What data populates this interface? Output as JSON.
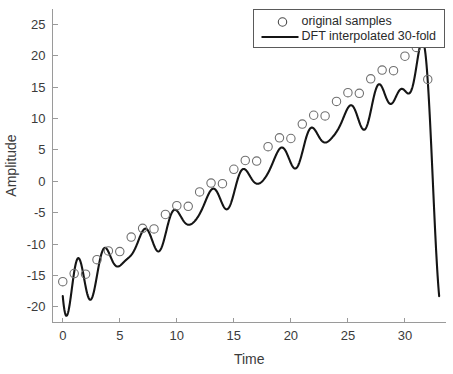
{
  "chart_data": {
    "type": "line",
    "title": "",
    "xlabel": "Time",
    "ylabel": "Amplitude",
    "xlim": [
      -0.9,
      33.6
    ],
    "ylim": [
      -22.5,
      27.5
    ],
    "xticks": [
      0,
      5,
      10,
      15,
      20,
      25,
      30
    ],
    "xticklabels": [
      "0",
      "5",
      "10",
      "15",
      "20",
      "25",
      "30"
    ],
    "yticks": [
      -20,
      -15,
      -10,
      -5,
      0,
      5,
      10,
      15,
      20,
      25
    ],
    "yticklabels": [
      "-20",
      "-15",
      "-10",
      "-5",
      "0",
      "5",
      "10",
      "15",
      "20",
      "25"
    ],
    "grid": false,
    "legend_position": "upper right",
    "legend": [
      {
        "label": "original samples",
        "marker": "circle-open",
        "linestyle": "none",
        "color": "#4a4a4a"
      },
      {
        "label": "DFT interpolated 30-fold",
        "marker": "none",
        "linestyle": "solid",
        "color": "#151515"
      }
    ],
    "model": {
      "description": "Linear ramp plus sinusoid, periodic DFT interpolation over 0..33",
      "ramp_slope": 1.09,
      "ramp_intercept": -17.6,
      "sine_amplitude": 2.05,
      "sine_period": 1.5,
      "sine_phase_deg": 200.0,
      "period_length": 33,
      "sample_interval": 1,
      "interpolation_factor": 30
    },
    "series": [
      {
        "name": "original samples",
        "x": [
          0,
          1,
          2,
          3,
          4,
          5,
          6,
          7,
          8,
          9,
          10,
          11,
          12,
          13,
          14,
          15,
          16,
          17,
          18,
          19,
          20,
          21,
          22,
          23,
          24,
          25,
          26,
          27,
          28,
          29,
          30,
          31,
          32
        ],
        "y": [
          -16.0,
          -14.7,
          -14.8,
          -12.5,
          -11.1,
          -11.2,
          -8.9,
          -7.5,
          -7.6,
          -5.3,
          -3.9,
          -4.0,
          -1.7,
          -0.3,
          -0.4,
          1.9,
          3.3,
          3.2,
          5.5,
          6.9,
          6.8,
          9.1,
          10.5,
          10.4,
          12.7,
          14.1,
          14.0,
          16.3,
          17.7,
          17.6,
          19.9,
          21.3,
          16.2
        ]
      },
      {
        "name": "DFT interpolated 30-fold",
        "x_range": [
          0,
          33
        ],
        "notes": "Smooth oscillating curve; starts near -16 at t=0, dips to about -20.3 near t=0.45, rises with ramp and ~1.5-unit ripple, peaks at about 20.3 near t=31.4, then falls steeply to about -15.3 at t=33."
      }
    ]
  }
}
